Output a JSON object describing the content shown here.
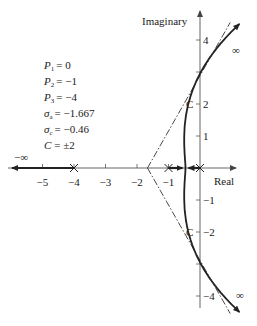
{
  "diagram": {
    "type": "root-locus",
    "axes": {
      "x_label": "Real",
      "y_label": "Imaginary",
      "x_range": [
        -5.8,
        1.6
      ],
      "y_range": [
        -4.6,
        5.1
      ],
      "x_ticks": [
        {
          "value": -5,
          "label": "−5"
        },
        {
          "value": -4,
          "label": "−4"
        },
        {
          "value": -3,
          "label": "−3"
        },
        {
          "value": -2,
          "label": "−2"
        },
        {
          "value": -1,
          "label": "−1"
        }
      ],
      "y_ticks": [
        {
          "value": 4,
          "label": "4"
        },
        {
          "value": 3,
          "label": ""
        },
        {
          "value": 2,
          "label": "2"
        },
        {
          "value": 1,
          "label": "1"
        },
        {
          "value": -1,
          "label": "−1"
        },
        {
          "value": -2,
          "label": "−2"
        },
        {
          "value": -3,
          "label": ""
        },
        {
          "value": -4,
          "label": "−4"
        }
      ]
    },
    "poles": [
      {
        "name": "P1",
        "real": 0,
        "imag": 0
      },
      {
        "name": "P2",
        "real": -1,
        "imag": 0
      },
      {
        "name": "P3",
        "real": -4,
        "imag": 0
      }
    ],
    "parameters": [
      {
        "symbol": "P",
        "sub": "1",
        "value": "= 0"
      },
      {
        "symbol": "P",
        "sub": "2",
        "value": "= −1"
      },
      {
        "symbol": "P",
        "sub": "3",
        "value": "= −4"
      },
      {
        "symbol": "σ",
        "sub": "a",
        "value": "= −1.667"
      },
      {
        "symbol": "σ",
        "sub": "c",
        "value": "= −0.46"
      },
      {
        "symbol": "C",
        "sub": "",
        "value": "= ±2"
      }
    ],
    "centroid": -1.667,
    "breakaway": -0.46,
    "crossing_imag": 2,
    "crossing_label": "C",
    "infinity_label": "∞",
    "neg_infinity_label": "−∞",
    "asymptote_angles_deg": [
      60,
      -60,
      180
    ],
    "colors": {
      "ink": "#222222",
      "axis": "#555555",
      "background": "#ffffff"
    }
  }
}
